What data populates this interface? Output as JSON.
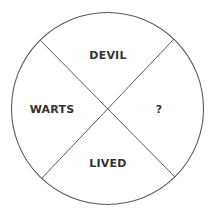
{
  "diagram": {
    "type": "quadrant-circle-puzzle",
    "circle": {
      "cx": 107.5,
      "cy": 108.5,
      "r": 96,
      "stroke": "#5a5a5a"
    },
    "dividers": [
      {
        "from": [
          40,
          40
        ],
        "to": [
          175,
          177
        ]
      },
      {
        "from": [
          174,
          39
        ],
        "to": [
          42,
          178
        ]
      }
    ],
    "segments": {
      "top": "DEVIL",
      "left": "WARTS",
      "bottom": "LIVED",
      "right": "?"
    },
    "colors": {
      "background": "#ffffff",
      "line": "#5a5a5a",
      "text": "#333333"
    }
  }
}
